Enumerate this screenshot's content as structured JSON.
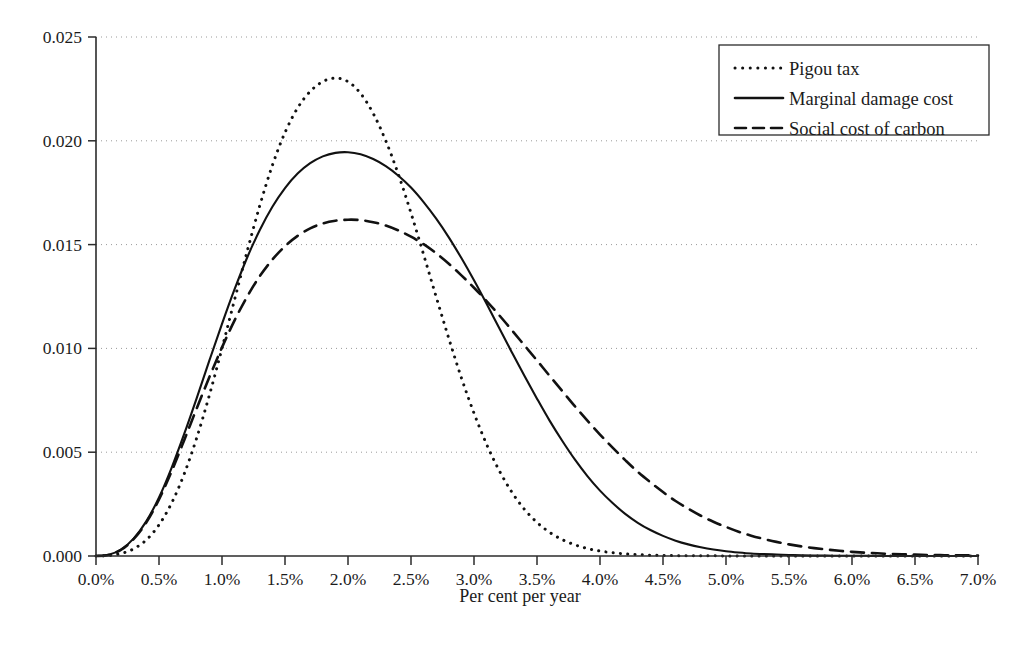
{
  "chart_data": {
    "type": "line",
    "title": "",
    "xlabel": "Per cent per year",
    "ylabel": "",
    "xlim": [
      0.0,
      7.0
    ],
    "ylim": [
      0.0,
      0.025
    ],
    "grid": true,
    "grid_axis": "y",
    "legend_position": "top-right",
    "x_tick_labels": [
      "0.0%",
      "0.5%",
      "1.0%",
      "1.5%",
      "2.0%",
      "2.5%",
      "3.0%",
      "3.5%",
      "4.0%",
      "4.5%",
      "5.0%",
      "5.5%",
      "6.0%",
      "6.5%",
      "7.0%"
    ],
    "x_tick_values": [
      0.0,
      0.5,
      1.0,
      1.5,
      2.0,
      2.5,
      3.0,
      3.5,
      4.0,
      4.5,
      5.0,
      5.5,
      6.0,
      6.5,
      7.0
    ],
    "y_tick_labels": [
      "0.000",
      "0.005",
      "0.010",
      "0.015",
      "0.020",
      "0.025"
    ],
    "y_tick_values": [
      0.0,
      0.005,
      0.01,
      0.015,
      0.02,
      0.025
    ],
    "x": [
      0.0,
      0.1,
      0.2,
      0.3,
      0.4,
      0.5,
      0.6,
      0.7,
      0.8,
      0.9,
      1.0,
      1.1,
      1.2,
      1.3,
      1.4,
      1.5,
      1.6,
      1.7,
      1.8,
      1.9,
      2.0,
      2.1,
      2.2,
      2.3,
      2.4,
      2.5,
      2.6,
      2.7,
      2.8,
      2.9,
      3.0,
      3.1,
      3.2,
      3.3,
      3.4,
      3.5,
      3.6,
      3.7,
      3.8,
      3.9,
      4.0,
      4.1,
      4.2,
      4.3,
      4.4,
      4.5,
      4.6,
      4.7,
      4.8,
      4.9,
      5.0,
      5.1,
      5.2,
      5.3,
      5.4,
      5.5,
      5.6,
      5.7,
      5.8,
      5.9,
      6.0,
      6.1,
      6.2,
      6.3,
      6.4,
      6.5,
      6.6,
      6.7,
      6.8,
      6.9,
      7.0
    ],
    "series": [
      {
        "name": "Pigou tax",
        "style": "dotted",
        "color": "#111111",
        "peak_value": 0.024,
        "peak_x": 1.85,
        "values": [
          0.0,
          2e-05,
          0.00012,
          0.00035,
          0.00078,
          0.0015,
          0.00255,
          0.00395,
          0.0057,
          0.00775,
          0.01,
          0.01235,
          0.01468,
          0.01688,
          0.01882,
          0.0204,
          0.02158,
          0.02238,
          0.02285,
          0.02302,
          0.02285,
          0.02228,
          0.02132,
          0.02,
          0.01838,
          0.01652,
          0.01452,
          0.01248,
          0.01048,
          0.00858,
          0.00688,
          0.00538,
          0.00412,
          0.00308,
          0.00225,
          0.00162,
          0.00114,
          0.00079,
          0.00054,
          0.00036,
          0.00024,
          0.00016,
          0.0001,
          7e-05,
          4e-05,
          3e-05,
          2e-05,
          1e-05,
          1e-05,
          1e-05,
          0.0,
          0.0,
          0.0,
          0.0,
          0.0,
          0.0,
          0.0,
          0.0,
          0.0,
          0.0,
          0.0,
          0.0,
          0.0,
          0.0,
          0.0,
          0.0,
          0.0,
          0.0,
          0.0,
          0.0,
          0.0
        ]
      },
      {
        "name": "Marginal damage cost",
        "style": "solid",
        "color": "#111111",
        "peak_value": 0.0203,
        "peak_x": 2.0,
        "values": [
          0.0,
          6e-05,
          0.00032,
          0.00085,
          0.00168,
          0.00282,
          0.00425,
          0.00588,
          0.00762,
          0.00942,
          0.01118,
          0.01285,
          0.01438,
          0.0157,
          0.01682,
          0.01772,
          0.01842,
          0.01892,
          0.01925,
          0.01942,
          0.01945,
          0.01935,
          0.01912,
          0.01878,
          0.01832,
          0.01775,
          0.01705,
          0.01625,
          0.01535,
          0.01435,
          0.01328,
          0.01215,
          0.01098,
          0.00982,
          0.00868,
          0.00758,
          0.00652,
          0.00555,
          0.00465,
          0.00385,
          0.00315,
          0.00255,
          0.00203,
          0.0016,
          0.00125,
          0.00097,
          0.00074,
          0.00056,
          0.00042,
          0.00031,
          0.00023,
          0.00017,
          0.00012,
          9e-05,
          7e-05,
          5e-05,
          3e-05,
          2e-05,
          2e-05,
          1e-05,
          1e-05,
          1e-05,
          0.0,
          0.0,
          0.0,
          0.0,
          0.0,
          0.0,
          0.0,
          0.0,
          0.0
        ]
      },
      {
        "name": "Social cost of carbon",
        "style": "dashed",
        "color": "#111111",
        "peak_value": 0.0182,
        "peak_x": 2.1,
        "values": [
          0.0,
          5e-05,
          0.0003,
          0.00082,
          0.00162,
          0.00272,
          0.00408,
          0.00558,
          0.00712,
          0.00862,
          0.01005,
          0.01135,
          0.0125,
          0.01348,
          0.01428,
          0.01492,
          0.01542,
          0.01578,
          0.01602,
          0.01615,
          0.0162,
          0.01618,
          0.01608,
          0.01592,
          0.01568,
          0.01538,
          0.01502,
          0.01458,
          0.01408,
          0.01352,
          0.01292,
          0.01228,
          0.0116,
          0.01088,
          0.01015,
          0.00942,
          0.00868,
          0.00795,
          0.00722,
          0.00652,
          0.00585,
          0.00522,
          0.00462,
          0.00405,
          0.00355,
          0.00308,
          0.00265,
          0.00228,
          0.00194,
          0.00165,
          0.0014,
          0.00117,
          0.00098,
          0.00082,
          0.00068,
          0.00056,
          0.00046,
          0.00038,
          0.00031,
          0.00025,
          0.0002,
          0.00016,
          0.00013,
          0.0001,
          8e-05,
          7e-05,
          5e-05,
          4e-05,
          3e-05,
          3e-05,
          2e-05
        ]
      }
    ]
  },
  "legend": {
    "entries": [
      {
        "label": "Pigou tax",
        "style": "dotted"
      },
      {
        "label": "Marginal damage cost",
        "style": "solid"
      },
      {
        "label": "Social cost of carbon",
        "style": "dashed"
      }
    ]
  },
  "axes": {
    "x_title": "Per cent per year"
  }
}
